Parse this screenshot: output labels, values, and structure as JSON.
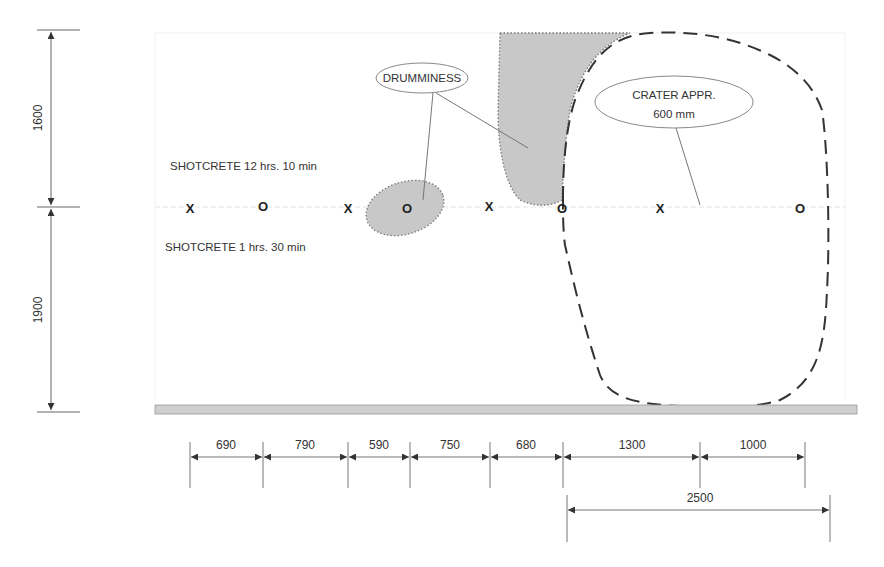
{
  "diagram": {
    "vertical_dims": [
      {
        "label": "1600",
        "from_y": 30,
        "to_y": 207
      },
      {
        "label": "1900",
        "from_y": 207,
        "to_y": 412
      }
    ],
    "notes": {
      "upper": "SHOTCRETE 12 hrs. 10 min",
      "lower": "SHOTCRETE 1 hrs. 30 min"
    },
    "markers": [
      {
        "symbol": "X",
        "x": 190
      },
      {
        "symbol": "O",
        "x": 263
      },
      {
        "symbol": "X",
        "x": 348
      },
      {
        "symbol": "O",
        "x": 407
      },
      {
        "symbol": "X",
        "x": 489
      },
      {
        "symbol": "O",
        "x": 562
      },
      {
        "symbol": "X",
        "x": 660
      },
      {
        "symbol": "O",
        "x": 800
      }
    ],
    "callouts": {
      "drumminess": "DRUMMINESS",
      "crater_line1": "CRATER APPR.",
      "crater_line2": "600 mm"
    },
    "horizontal_dims": [
      {
        "label": "690",
        "x1": 190,
        "x2": 263
      },
      {
        "label": "790",
        "x1": 263,
        "x2": 348
      },
      {
        "label": "590",
        "x1": 348,
        "x2": 410
      },
      {
        "label": "750",
        "x1": 410,
        "x2": 490
      },
      {
        "label": "680",
        "x1": 490,
        "x2": 563
      },
      {
        "label": "1300",
        "x1": 563,
        "x2": 700
      },
      {
        "label": "1000",
        "x1": 700,
        "x2": 805
      }
    ],
    "total_dim": {
      "label": "2500",
      "x1": 567,
      "x2": 830
    },
    "colors": {
      "shade": "#c8c8c8",
      "line": "#555555",
      "crater": "#333333",
      "floor": "#cfcfcf"
    }
  }
}
